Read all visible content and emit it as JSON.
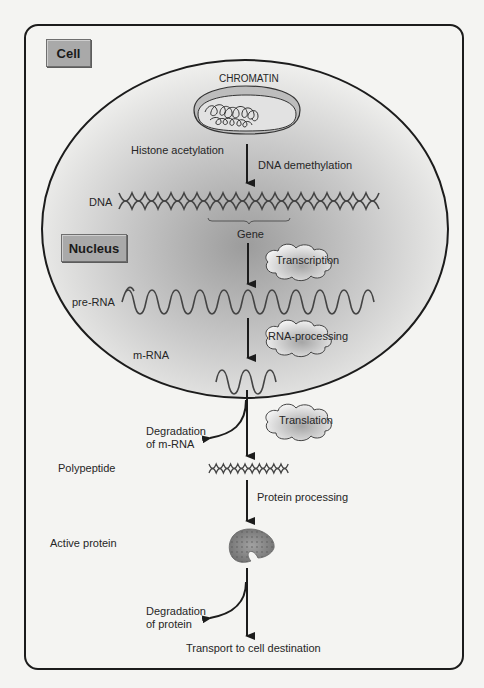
{
  "diagram": {
    "type": "flow",
    "compartments": {
      "cell_label": "Cell",
      "nucleus_label": "Nucleus"
    },
    "structures": {
      "chromatin": "CHROMATIN",
      "dna": "DNA",
      "gene": "Gene",
      "pre_rna": "pre-RNA",
      "m_rna": "m-RNA",
      "polypeptide": "Polypeptide",
      "active_protein": "Active protein"
    },
    "annotations": {
      "histone_acetylation": "Histone acetylation",
      "dna_demethylation": "DNA demethylation",
      "protein_processing": "Protein processing",
      "degradation_mrna_line1": "Degradation",
      "degradation_mrna_line2": "of m-RNA",
      "degradation_protein_line1": "Degradation",
      "degradation_protein_line2": "of protein",
      "transport": "Transport to cell destination"
    },
    "processes": {
      "transcription": "Transcription",
      "rna_processing": "RNA-processing",
      "translation": "Translation"
    },
    "colors": {
      "line": "#1c1c1c",
      "label_box": "#a9a9a9",
      "nucleus_shade": "#9a9a9a",
      "protein": "#8a8a8a"
    }
  }
}
